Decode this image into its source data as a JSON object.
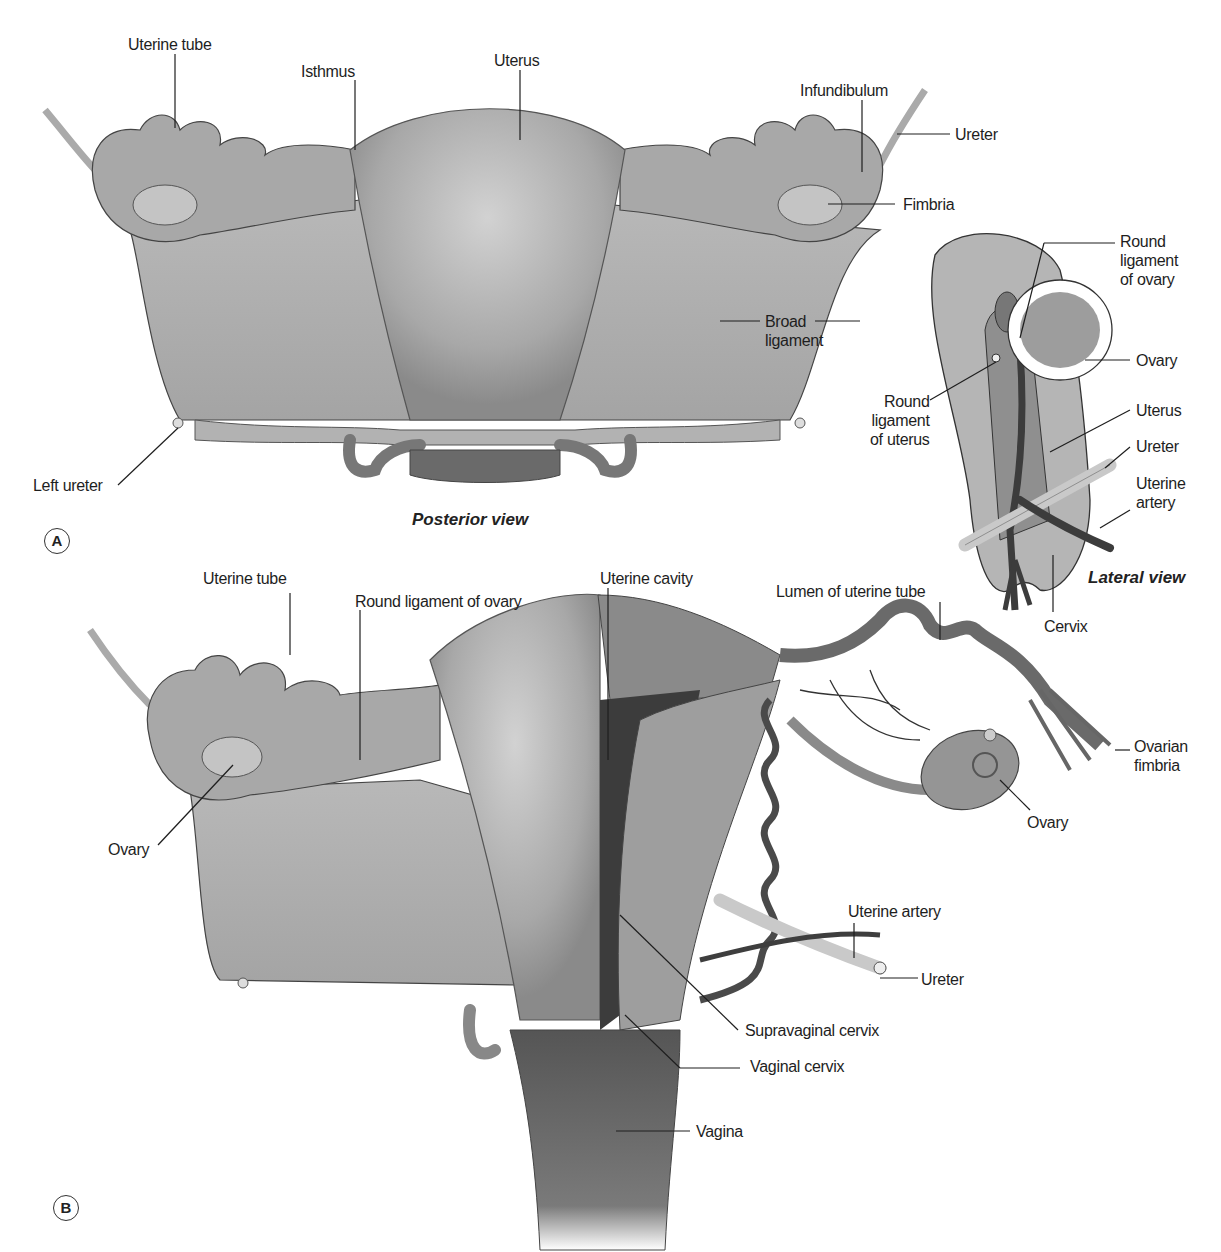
{
  "figure": {
    "panel_a": {
      "badge": "A",
      "view_title": "Posterior view",
      "labels": {
        "uterine_tube": "Uterine tube",
        "isthmus": "Isthmus",
        "uterus": "Uterus",
        "infundibulum": "Infundibulum",
        "ureter": "Ureter",
        "fimbria": "Fimbria",
        "broad_ligament": "Broad\nligament",
        "left_ureter": "Left ureter"
      }
    },
    "lateral": {
      "view_title": "Lateral view",
      "labels": {
        "round_ligament_ovary": "Round\nligament\nof ovary",
        "ovary": "Ovary",
        "round_ligament_uterus": "Round\nligament\nof uterus",
        "uterus": "Uterus",
        "ureter": "Ureter",
        "uterine_artery": "Uterine\nartery",
        "cervix": "Cervix"
      }
    },
    "panel_b": {
      "badge": "B",
      "labels": {
        "uterine_tube": "Uterine tube",
        "round_ligament_ovary": "Round ligament of ovary",
        "uterine_cavity": "Uterine cavity",
        "lumen_uterine_tube": "Lumen of uterine tube",
        "ovarian_fimbria": "Ovarian\nfimbria",
        "ovary_right": "Ovary",
        "ovary_left": "Ovary",
        "uterine_artery": "Uterine artery",
        "ureter": "Ureter",
        "supravaginal_cervix": "Supravaginal cervix",
        "vaginal_cervix": "Vaginal cervix",
        "vagina": "Vagina"
      }
    },
    "colors": {
      "tissue_light": "#b9b9b9",
      "tissue_mid": "#9a9a9a",
      "tissue_dark": "#5a5a5a",
      "cavity_dark": "#3c3c3c",
      "outline": "#333333",
      "leader_line": "#1e1e1e"
    }
  }
}
